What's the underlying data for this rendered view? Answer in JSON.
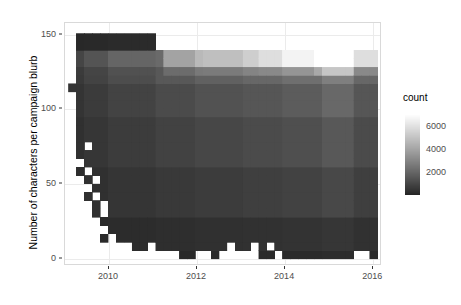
{
  "chart_data": {
    "type": "heatmap",
    "title": "",
    "xlabel": "",
    "ylabel": "Number of characters per campaign blurb",
    "xlim": [
      2009.0,
      2016.2
    ],
    "ylim": [
      -5,
      158
    ],
    "grid": true,
    "legend_position": "right",
    "legend": {
      "title": "count",
      "ticks": [
        2000,
        4000,
        6000
      ],
      "tick_labels": [
        "2000",
        "4000",
        "6000"
      ],
      "range": [
        0,
        7000
      ],
      "low_color": "#252525",
      "high_color": "#ffffff",
      "missing_color": "#ffffff"
    },
    "xaxis": {
      "ticks": [
        2010,
        2012,
        2014,
        2016
      ],
      "tick_labels": [
        "2010",
        "2012",
        "2014",
        "2016"
      ]
    },
    "yaxis": {
      "ticks": [
        0,
        50,
        100,
        150
      ],
      "tick_labels": [
        "0",
        "50",
        "100",
        "150"
      ]
    },
    "bin_width_x": 0.18,
    "bin_height_y": 5.6,
    "x_bin_edges": [
      2009.07,
      2009.25,
      2009.43,
      2009.61,
      2009.79,
      2009.97,
      2010.15,
      2010.33,
      2010.51,
      2010.69,
      2010.87,
      2011.05,
      2011.23,
      2011.41,
      2011.59,
      2011.77,
      2011.95,
      2012.13,
      2012.31,
      2012.49,
      2012.67,
      2012.85,
      2013.03,
      2013.21,
      2013.39,
      2013.57,
      2013.75,
      2013.93,
      2014.11,
      2014.29,
      2014.47,
      2014.65,
      2014.83,
      2015.01,
      2015.19,
      2015.37,
      2015.55,
      2015.73,
      2015.91,
      2016.09
    ],
    "y_bin_edges": [
      0,
      5.6,
      11.2,
      16.8,
      22.4,
      28,
      33.6,
      39.2,
      44.8,
      50.4,
      56,
      61.6,
      67.2,
      72.8,
      78.4,
      84,
      89.6,
      95.2,
      100.8,
      106.4,
      112,
      117.6,
      123.2,
      128.8,
      134.4,
      140,
      145.6,
      151.2
    ]
  }
}
